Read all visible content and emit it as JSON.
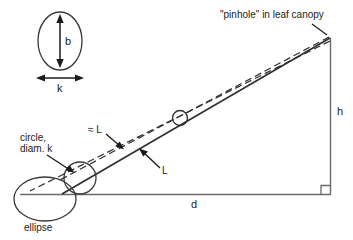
{
  "figure": {
    "type": "geometric-diagram",
    "background_color": "#ffffff",
    "line_color": "#3a3a3a",
    "text_color": "#1a1a1a",
    "width": 353,
    "height": 240
  },
  "labels": {
    "title": "\"pinhole\" in leaf canopy",
    "height_label": "h",
    "distance_label": "d",
    "path_label_approx": "≈ L",
    "path_label": "L",
    "circle_label_line1": "circle,",
    "circle_label_line2": "diam. k",
    "ellipse_label": "ellipse",
    "inset_minor_axis": "k",
    "inset_major_axis": "b"
  },
  "inset": {
    "name": "pinhole-shape-inset",
    "description": "ellipse with vertical double-headed arrow labelled b and horizontal double-headed arrow labelled k",
    "vertical_arrow_label": "b",
    "horizontal_arrow_label": "k"
  },
  "triangle": {
    "apex_label": "\"pinhole\" in leaf canopy",
    "vertical_side_label": "h",
    "horizontal_side_label": "d",
    "right_angle_marker": true
  },
  "ground_shapes": [
    {
      "name": "ellipse",
      "label": "ellipse"
    },
    {
      "name": "circle",
      "label": "circle, diam. k"
    }
  ],
  "rays": [
    {
      "name": "principal-ray",
      "style": "solid",
      "label": "L"
    },
    {
      "name": "upper-bounding-ray",
      "style": "dashed",
      "label": "≈ L"
    },
    {
      "name": "lower-bounding-ray",
      "style": "dashed",
      "label": ""
    }
  ]
}
